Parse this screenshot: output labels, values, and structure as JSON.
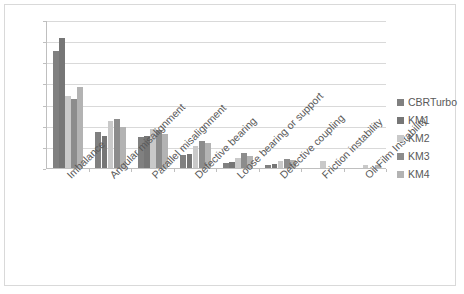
{
  "chart_data": {
    "type": "bar",
    "title": "",
    "xlabel": "",
    "ylabel": "",
    "ylim": [
      0,
      0.7
    ],
    "grid": true,
    "legend_position": "right",
    "decimal_separator": ",",
    "categories": [
      "Imbalance",
      "Angular misalignment",
      "Parallel misalignment",
      "Defective bearing",
      "Loose bearing or support",
      "Defective coupling",
      "Friction instability",
      "Oil Film Instability"
    ],
    "y_ticks": [
      "0,7",
      "0,6",
      "0,5",
      "0,4",
      "0,3",
      "0,2",
      "0,1",
      "0"
    ],
    "y_tick_values": [
      0.7,
      0.6,
      0.5,
      0.4,
      0.3,
      0.2,
      0.1,
      0
    ],
    "series": [
      {
        "name": "CBRTurbo",
        "color": "#808080",
        "values": [
          0.555,
          0.17,
          0.147,
          0.06,
          0.022,
          0.012,
          0.0,
          0.0
        ]
      },
      {
        "name": "KM1",
        "color": "#767676",
        "values": [
          0.615,
          0.152,
          0.152,
          0.066,
          0.03,
          0.018,
          0.0,
          0.0
        ]
      },
      {
        "name": "KM2",
        "color": "#c9c9c9",
        "values": [
          0.342,
          0.222,
          0.185,
          0.106,
          0.048,
          0.033,
          0.031,
          0.014
        ]
      },
      {
        "name": "KM3",
        "color": "#8c8c8c",
        "values": [
          0.325,
          0.23,
          0.178,
          0.127,
          0.072,
          0.045,
          0.0,
          0.0
        ]
      },
      {
        "name": "KM4",
        "color": "#b3b3b3",
        "values": [
          0.383,
          0.195,
          0.16,
          0.118,
          0.057,
          0.04,
          0.002,
          0.013
        ]
      }
    ]
  }
}
